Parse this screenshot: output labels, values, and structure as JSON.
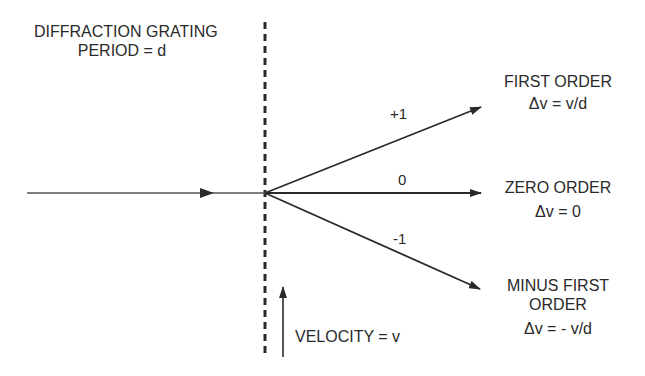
{
  "title_block": {
    "line1": "DIFFRACTION GRATING",
    "line2": "PERIOD = d"
  },
  "orders": {
    "plus_one": {
      "beam_label": "+1",
      "name": "FIRST ORDER",
      "shift": "Δv = v/d"
    },
    "zero": {
      "beam_label": "0",
      "name": "ZERO ORDER",
      "shift": "Δv = 0"
    },
    "minus_one": {
      "beam_label": "-1",
      "name_line1": "MINUS FIRST",
      "name_line2": "ORDER",
      "shift": "Δv = - v/d"
    }
  },
  "velocity": {
    "label": "VELOCITY = v"
  },
  "colors": {
    "ink": "#2a2a2a",
    "background": "#ffffff"
  }
}
